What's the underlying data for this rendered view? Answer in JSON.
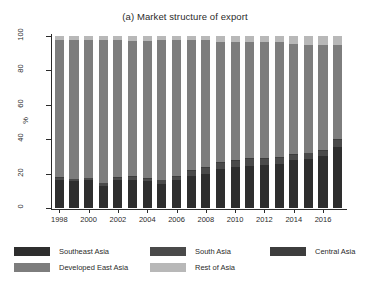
{
  "chart_data": {
    "type": "bar",
    "subtype": "stacked-percentage-bar",
    "title": "(a) Market structure of export",
    "xlabel": "",
    "ylabel": "%",
    "ylim": [
      0,
      100
    ],
    "yticks": [
      0,
      20,
      40,
      60,
      80,
      100
    ],
    "grid": false,
    "legend_position": "bottom",
    "categories": [
      "1998",
      "1999",
      "2000",
      "2001",
      "2002",
      "2003",
      "2004",
      "2005",
      "2006",
      "2007",
      "2008",
      "2009",
      "2010",
      "2011",
      "2012",
      "2013",
      "2014",
      "2015",
      "2016",
      "2017"
    ],
    "xtick_labels": [
      "1998",
      "2000",
      "2002",
      "2004",
      "2006",
      "2008",
      "2010",
      "2012",
      "2014",
      "2016"
    ],
    "series": [
      {
        "name": "Southeast Asia",
        "color": "#2e2e2e",
        "values": [
          16.5,
          15.5,
          16.0,
          13.0,
          16.0,
          16.5,
          15.5,
          14.0,
          16.0,
          18.5,
          20.0,
          22.5,
          24.0,
          24.5,
          25.0,
          25.5,
          28.0,
          28.5,
          30.0,
          35.5
        ]
      },
      {
        "name": "South Asia",
        "color": "#4a4a4a",
        "values": [
          1.2,
          1.2,
          1.3,
          1.3,
          1.5,
          1.5,
          1.6,
          2.0,
          2.2,
          3.0,
          3.5,
          3.8,
          3.5,
          3.8,
          3.5,
          3.5,
          3.0,
          3.2,
          3.2,
          4.0
        ]
      },
      {
        "name": "Central Asia",
        "color": "#3d3d3d",
        "values": [
          0.4,
          0.4,
          0.4,
          0.4,
          0.4,
          0.4,
          0.4,
          0.4,
          0.5,
          0.5,
          0.5,
          0.5,
          0.5,
          0.5,
          0.5,
          0.5,
          0.5,
          0.5,
          0.5,
          0.5
        ]
      },
      {
        "name": "Developed East Asia",
        "color": "#7d7d7d",
        "values": [
          79.4,
          80.4,
          79.8,
          82.8,
          79.6,
          78.9,
          79.8,
          81.1,
          78.8,
          75.5,
          73.5,
          69.7,
          68.5,
          67.7,
          67.5,
          66.8,
          63.8,
          62.8,
          61.3,
          54.5
        ]
      },
      {
        "name": "Rest of Asia",
        "color": "#b8b8b8",
        "values": [
          2.5,
          2.5,
          2.5,
          2.5,
          2.5,
          2.7,
          2.7,
          2.5,
          2.5,
          2.5,
          2.5,
          3.5,
          3.5,
          3.5,
          3.5,
          3.7,
          4.7,
          5.0,
          5.0,
          5.5
        ]
      }
    ]
  },
  "legend": {
    "items": [
      {
        "label": "Southeast Asia",
        "color": "#2e2e2e"
      },
      {
        "label": "South Asia",
        "color": "#4a4a4a"
      },
      {
        "label": "Central Asia",
        "color": "#3d3d3d"
      },
      {
        "label": "Developed East Asia",
        "color": "#7d7d7d"
      },
      {
        "label": "Rest of Asia",
        "color": "#b8b8b8"
      }
    ]
  }
}
